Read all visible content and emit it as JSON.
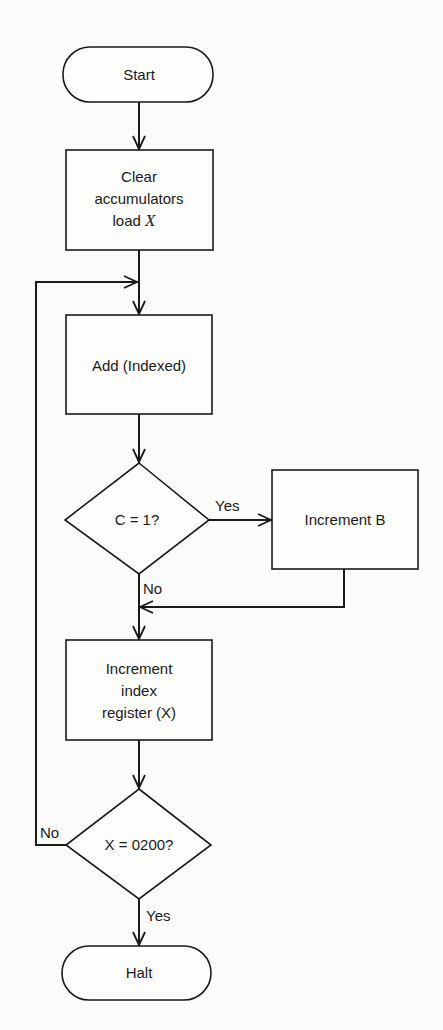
{
  "diagram": {
    "type": "flowchart",
    "nodes": {
      "start": {
        "shape": "terminator",
        "label": "Start"
      },
      "clear": {
        "shape": "process",
        "lines": [
          "Clear",
          "accumulators",
          "load "
        ],
        "var": "X"
      },
      "add": {
        "shape": "process",
        "label": "Add (Indexed)"
      },
      "decision_c": {
        "shape": "decision",
        "label": "C = 1?"
      },
      "inc_b": {
        "shape": "process",
        "label": "Increment B"
      },
      "inc_x": {
        "shape": "process",
        "lines": [
          "Increment",
          "index",
          "register (X)"
        ]
      },
      "decision_x": {
        "shape": "decision",
        "label": "X = 0200?"
      },
      "halt": {
        "shape": "terminator",
        "label": "Halt"
      }
    },
    "edge_labels": {
      "c_yes": "Yes",
      "c_no": "No",
      "x_no": "No",
      "x_yes": "Yes"
    },
    "edges": [
      [
        "start",
        "clear"
      ],
      [
        "clear",
        "add"
      ],
      [
        "add",
        "decision_c"
      ],
      [
        "decision_c",
        "inc_b",
        "Yes"
      ],
      [
        "decision_c",
        "inc_x",
        "No"
      ],
      [
        "inc_b",
        "inc_x"
      ],
      [
        "inc_x",
        "decision_x"
      ],
      [
        "decision_x",
        "add",
        "No"
      ],
      [
        "decision_x",
        "halt",
        "Yes"
      ]
    ]
  }
}
